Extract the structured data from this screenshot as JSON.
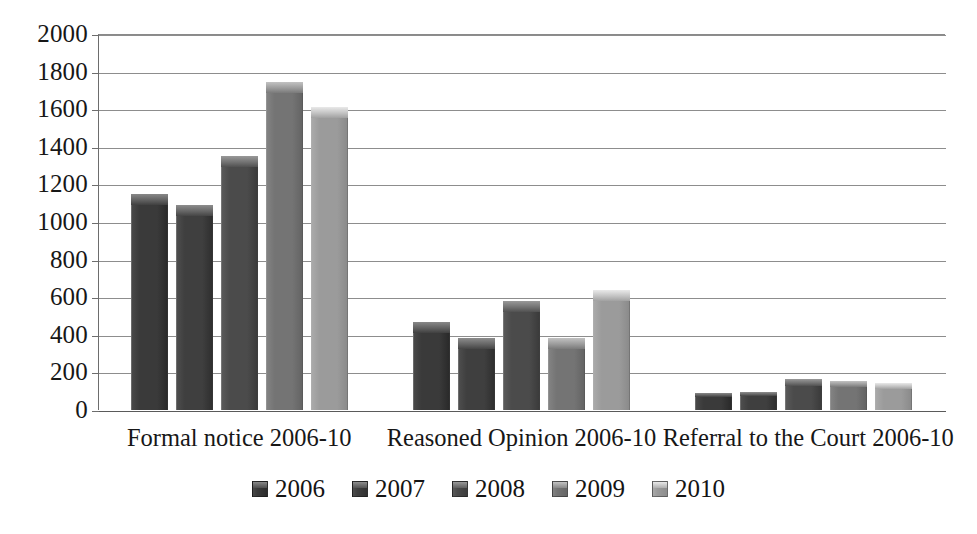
{
  "chart_data": {
    "type": "bar",
    "title": "",
    "subtitle": "",
    "xlabel": "",
    "ylabel": "",
    "ylim": [
      0,
      2000
    ],
    "ytick_step": 200,
    "yticks": [
      2000,
      1800,
      1600,
      1400,
      1200,
      1000,
      800,
      600,
      400,
      200,
      0
    ],
    "ytick_labels": [
      "2000",
      "1800",
      "1600",
      "1400",
      "1200",
      "1000",
      "800",
      "600",
      "400",
      "200",
      "0"
    ],
    "grid": true,
    "grid_axis": "y",
    "legend_position": "bottom",
    "categories": [
      "Formal notice 2006-10",
      "Reasoned Opinion 2006-10",
      "Referral to the Court 2006-10"
    ],
    "series": [
      {
        "name": "2006",
        "color": "#3a3a3a",
        "values": [
          1150,
          470,
          90
        ]
      },
      {
        "name": "2007",
        "color": "#3f3f3f",
        "values": [
          1090,
          385,
          95
        ]
      },
      {
        "name": "2008",
        "color": "#4b4b4b",
        "values": [
          1350,
          580,
          165
        ]
      },
      {
        "name": "2009",
        "color": "#747474",
        "values": [
          1745,
          385,
          155
        ]
      },
      {
        "name": "2010",
        "color": "#9b9b9b",
        "values": [
          1610,
          640,
          145
        ]
      }
    ]
  },
  "legend": {
    "items": [
      {
        "label": "2006"
      },
      {
        "label": "2007"
      },
      {
        "label": "2008"
      },
      {
        "label": "2009"
      },
      {
        "label": "2010"
      }
    ]
  },
  "colors": {
    "background": "#ffffff",
    "gridline": "#8d8d8d",
    "axis": "#5a5a5a",
    "text": "#171717"
  }
}
